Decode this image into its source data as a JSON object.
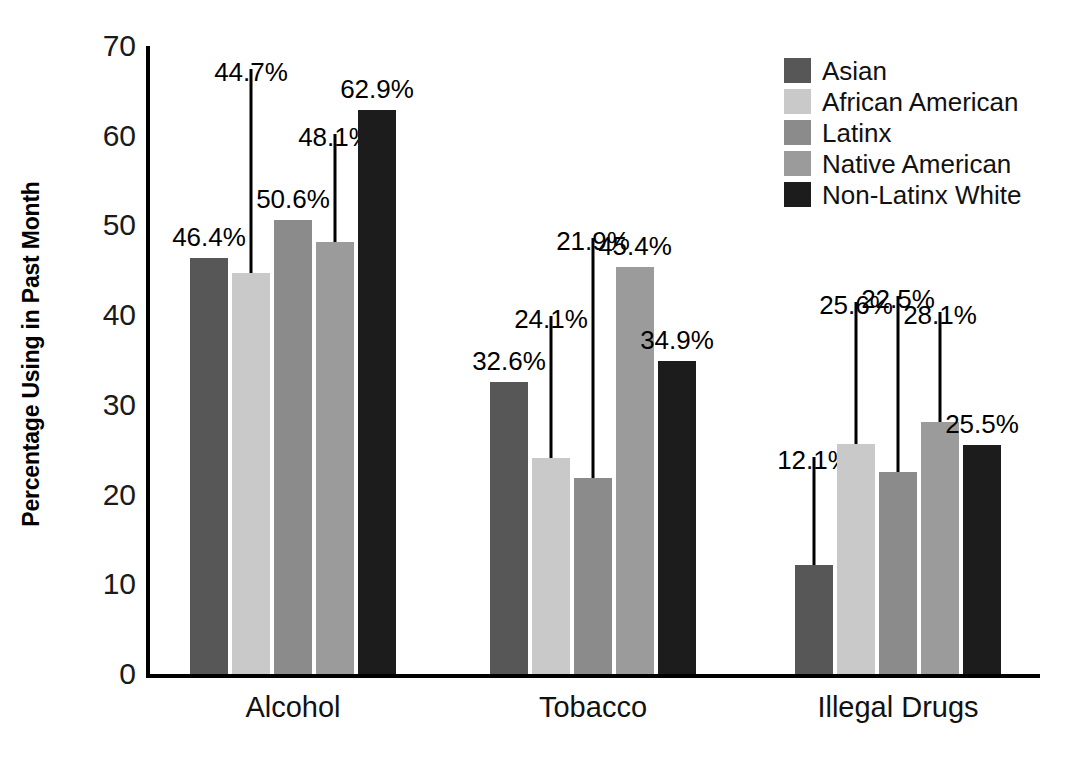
{
  "chart_data": {
    "type": "bar",
    "title": "",
    "subtitle": "",
    "xlabel": "",
    "ylabel": "Percentage Using in Past Month",
    "ylim": [
      0,
      70
    ],
    "ytick_labels": [
      "70",
      "60",
      "50",
      "40",
      "30",
      "20",
      "10",
      "0"
    ],
    "ytick_values": [
      70,
      60,
      50,
      40,
      30,
      20,
      10,
      0
    ],
    "grid": false,
    "legend_position": "top-right",
    "categories": [
      "Alcohol",
      "Tobacco",
      "Illegal Drugs"
    ],
    "series": [
      {
        "name": "Asian",
        "color": "#575757",
        "values": [
          46.4,
          32.6,
          12.1
        ],
        "labels": [
          "46.4%",
          "32.6%",
          "12.1%"
        ]
      },
      {
        "name": "African American",
        "color": "#c9c9c9",
        "values": [
          44.7,
          24.1,
          25.6
        ],
        "labels": [
          "44.7%",
          "24.1%",
          "25.6%"
        ]
      },
      {
        "name": "Latinx",
        "color": "#8b8b8b",
        "values": [
          50.6,
          21.9,
          22.5
        ],
        "labels": [
          "50.6%",
          "21.9%",
          "22.5%"
        ]
      },
      {
        "name": "Native American",
        "color": "#9b9b9b",
        "values": [
          48.1,
          45.4,
          28.1
        ],
        "labels": [
          "48.1%",
          "45.4%",
          "28.1%"
        ]
      },
      {
        "name": "Non-Latinx White",
        "color": "#1c1c1c",
        "values": [
          62.9,
          34.9,
          25.5
        ],
        "labels": [
          "62.9%",
          "34.9%",
          "25.5%"
        ]
      }
    ],
    "annotations": [
      {
        "group": "Alcohol",
        "series": "Asian",
        "text": "46.4%",
        "leader": false
      },
      {
        "group": "Alcohol",
        "series": "African American",
        "text": "44.7%",
        "leader": true
      },
      {
        "group": "Alcohol",
        "series": "Latinx",
        "text": "50.6%",
        "leader": false
      },
      {
        "group": "Alcohol",
        "series": "Native American",
        "text": "48.1%",
        "leader": true
      },
      {
        "group": "Alcohol",
        "series": "Non-Latinx White",
        "text": "62.9%",
        "leader": false
      },
      {
        "group": "Tobacco",
        "series": "Asian",
        "text": "32.6%",
        "leader": false
      },
      {
        "group": "Tobacco",
        "series": "African American",
        "text": "24.1%",
        "leader": true
      },
      {
        "group": "Tobacco",
        "series": "Latinx",
        "text": "21.9%",
        "leader": true
      },
      {
        "group": "Tobacco",
        "series": "Native American",
        "text": "45.4%",
        "leader": false
      },
      {
        "group": "Tobacco",
        "series": "Non-Latinx White",
        "text": "34.9%",
        "leader": false
      },
      {
        "group": "Illegal Drugs",
        "series": "Asian",
        "text": "12.1%",
        "leader": true
      },
      {
        "group": "Illegal Drugs",
        "series": "African American",
        "text": "25.6%",
        "leader": true
      },
      {
        "group": "Illegal Drugs",
        "series": "Latinx",
        "text": "22.5%",
        "leader": true
      },
      {
        "group": "Illegal Drugs",
        "series": "Native American",
        "text": "28.1%",
        "leader": true
      },
      {
        "group": "Illegal Drugs",
        "series": "Non-Latinx White",
        "text": "25.5%",
        "leader": false
      }
    ]
  },
  "legend": {
    "items": [
      {
        "label": "Asian",
        "color": "#575757"
      },
      {
        "label": "African American",
        "color": "#c9c9c9"
      },
      {
        "label": "Latinx",
        "color": "#8b8b8b"
      },
      {
        "label": "Native American",
        "color": "#9b9b9b"
      },
      {
        "label": "Non-Latinx White",
        "color": "#1c1c1c"
      }
    ]
  },
  "axis": {
    "y_title": "Percentage Using in Past Month"
  }
}
